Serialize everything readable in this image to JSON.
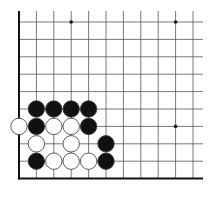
{
  "board": {
    "origin_x": 19,
    "origin_y": 22,
    "spacing": 17.4,
    "cols": 11,
    "rows": 10,
    "right_extent": 203,
    "top_extent": 11,
    "edges": [
      "left",
      "bottom"
    ],
    "star_points": [
      [
        3,
        0
      ],
      [
        9,
        0
      ],
      [
        9,
        6
      ]
    ],
    "stones": [
      {
        "color": "black",
        "col": 1,
        "row": 5
      },
      {
        "color": "black",
        "col": 2,
        "row": 5
      },
      {
        "color": "black",
        "col": 3,
        "row": 5
      },
      {
        "color": "black",
        "col": 4,
        "row": 5
      },
      {
        "color": "white",
        "col": 0,
        "row": 6
      },
      {
        "color": "black",
        "col": 1,
        "row": 6
      },
      {
        "color": "white",
        "col": 2,
        "row": 6
      },
      {
        "color": "white",
        "col": 3,
        "row": 6
      },
      {
        "color": "black",
        "col": 4,
        "row": 6
      },
      {
        "color": "white",
        "col": 1,
        "row": 7
      },
      {
        "color": "white",
        "col": 3,
        "row": 7
      },
      {
        "color": "black",
        "col": 5,
        "row": 7
      },
      {
        "color": "black",
        "col": 1,
        "row": 8
      },
      {
        "color": "white",
        "col": 2,
        "row": 8
      },
      {
        "color": "white",
        "col": 3,
        "row": 8
      },
      {
        "color": "white",
        "col": 4,
        "row": 8
      },
      {
        "color": "black",
        "col": 5,
        "row": 8
      }
    ],
    "colors": {
      "line": "#555555",
      "edge": "#111111",
      "black": "#111111",
      "white": "#ffffff",
      "stone_outline": "#333333"
    }
  }
}
